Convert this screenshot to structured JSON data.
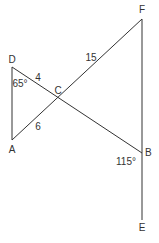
{
  "diagram": {
    "type": "geometry",
    "line_color": "#333333",
    "points": {
      "D": {
        "label": "D",
        "x": 12,
        "y": 67
      },
      "A": {
        "label": "A",
        "x": 12,
        "y": 140
      },
      "C": {
        "label": "C",
        "x": 59,
        "y": 98
      },
      "F": {
        "label": "F",
        "x": 142,
        "y": 19
      },
      "B": {
        "label": "B",
        "x": 142,
        "y": 153
      },
      "E": {
        "label": "E",
        "x": 142,
        "y": 220
      }
    },
    "segments": [
      {
        "from": "D",
        "to": "A"
      },
      {
        "from": "D",
        "to": "B"
      },
      {
        "from": "A",
        "to": "F"
      },
      {
        "from": "F",
        "to": "E"
      }
    ],
    "measurements": {
      "DC": "4",
      "CF": "15",
      "AC": "6",
      "angle_D": "65°",
      "angle_B": "115°"
    }
  }
}
